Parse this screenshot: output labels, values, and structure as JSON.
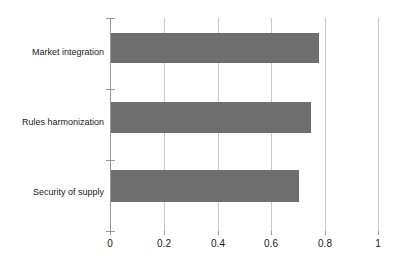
{
  "chart_data": {
    "type": "bar",
    "orientation": "horizontal",
    "title": "",
    "xlabel": "",
    "ylabel": "",
    "categories": [
      "Market integration",
      "Rules harmonization",
      "Security of supply"
    ],
    "values": [
      0.78,
      0.75,
      0.705
    ],
    "xlim": [
      0,
      1
    ],
    "xticks": [
      0,
      0.2,
      0.4,
      0.6,
      0.8,
      1
    ],
    "xtick_labels": [
      "0",
      "0.2",
      "0.4",
      "0.6",
      "0.8",
      "1"
    ],
    "grid": "vertical",
    "legend": "none",
    "series": [
      {
        "name": "",
        "values": [
          0.78,
          0.75,
          0.705
        ]
      }
    ],
    "colors": {
      "bar_fill": "#6e6e6e",
      "gridline": "#c8c8c8",
      "axis": "#9a9a9a",
      "text": "#1a1a1a",
      "background": "#ffffff"
    }
  }
}
